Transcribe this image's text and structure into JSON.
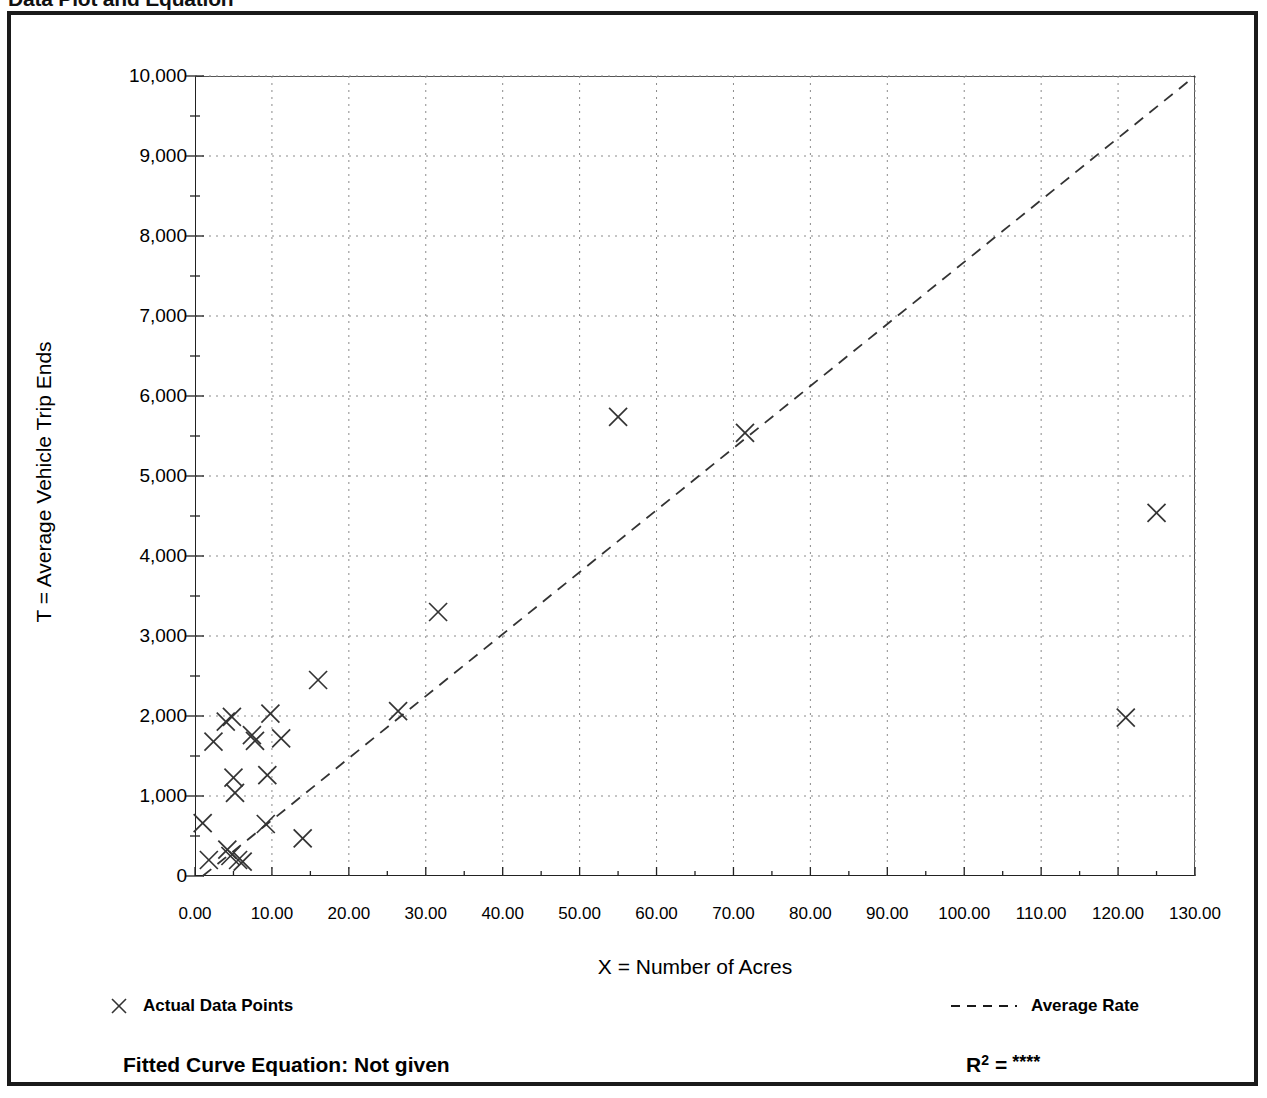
{
  "document": {
    "title": "Data Plot and Equation"
  },
  "chart_data": {
    "type": "scatter",
    "title": "Data Plot and Equation",
    "xlabel": "X = Number of Acres",
    "ylabel": "T = Average Vehicle Trip Ends",
    "xlim": [
      0,
      130
    ],
    "ylim": [
      0,
      10000
    ],
    "xticks": [
      "0.00",
      "10.00",
      "20.00",
      "30.00",
      "40.00",
      "50.00",
      "60.00",
      "70.00",
      "80.00",
      "90.00",
      "100.00",
      "110.00",
      "120.00",
      "130.00"
    ],
    "xtick_values": [
      0,
      10,
      20,
      30,
      40,
      50,
      60,
      70,
      80,
      90,
      100,
      110,
      120,
      130
    ],
    "yticks": [
      "0",
      "1,000",
      "2,000",
      "3,000",
      "4,000",
      "5,000",
      "6,000",
      "7,000",
      "8,000",
      "9,000",
      "10,000"
    ],
    "ytick_values": [
      0,
      1000,
      2000,
      3000,
      4000,
      5000,
      6000,
      7000,
      8000,
      9000,
      10000
    ],
    "x_minor_step": 5,
    "y_minor_step": 500,
    "grid": true,
    "grid_style": "dotted",
    "legend_position": "below-plot",
    "series": [
      {
        "name": "Actual Data Points",
        "marker": "x",
        "color": "#333333",
        "points": [
          [
            1.0,
            660
          ],
          [
            1.8,
            200
          ],
          [
            2.4,
            1680
          ],
          [
            4.0,
            1930
          ],
          [
            4.2,
            330
          ],
          [
            4.6,
            250
          ],
          [
            4.8,
            1990
          ],
          [
            5.0,
            1230
          ],
          [
            5.2,
            1040
          ],
          [
            5.6,
            200
          ],
          [
            6.2,
            180
          ],
          [
            7.4,
            1760
          ],
          [
            7.8,
            1690
          ],
          [
            9.2,
            650
          ],
          [
            9.4,
            1260
          ],
          [
            9.8,
            2030
          ],
          [
            11.2,
            1720
          ],
          [
            14.0,
            470
          ],
          [
            16.0,
            2450
          ],
          [
            26.4,
            2060
          ],
          [
            31.6,
            3300
          ],
          [
            55.0,
            5740
          ],
          [
            71.5,
            5540
          ],
          [
            121.0,
            1980
          ],
          [
            125.0,
            4540
          ]
        ]
      },
      {
        "name": "Average Rate",
        "marker": "dashed-line",
        "color": "#333333",
        "line": [
          [
            1.0,
            0
          ],
          [
            130.0,
            10000
          ]
        ]
      }
    ]
  },
  "legend": {
    "points_label": "Actual Data Points",
    "rate_label": "Average Rate",
    "points_icon": "x-marker-icon",
    "rate_icon": "dashed-line-icon"
  },
  "footer": {
    "fitted_curve": "Fitted Curve Equation:  Not given",
    "r2_label": "R",
    "r2_exponent": "2",
    "r2_equals": "=",
    "r2_value": "****"
  },
  "colors": {
    "ink": "#1a1a1a",
    "grid": "#8a8a8a",
    "marker": "#333333"
  }
}
